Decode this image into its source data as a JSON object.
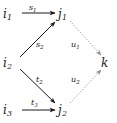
{
  "diagram": {
    "type": "commutative-diagram",
    "background_color": "#ffffff",
    "stroke_color": "#1a1a1a",
    "dotted_stroke_color": "#9a9a9a",
    "nodes": [
      {
        "id": "i1",
        "base": "i",
        "subscript": "1",
        "x": 12,
        "y": 14
      },
      {
        "id": "j1",
        "base": "j",
        "subscript": "1",
        "x": 64,
        "y": 14
      },
      {
        "id": "i2",
        "base": "i",
        "subscript": "2",
        "x": 12,
        "y": 63
      },
      {
        "id": "k",
        "base": "k",
        "subscript": "",
        "x": 105,
        "y": 63
      },
      {
        "id": "i3",
        "base": "i",
        "subscript": "3",
        "x": 12,
        "y": 110
      },
      {
        "id": "j2",
        "base": "j",
        "subscript": "2",
        "x": 64,
        "y": 110
      }
    ],
    "edges": [
      {
        "id": "e-s1",
        "from": "i1",
        "to": "j1",
        "label_base": "s",
        "label_subscript": "1",
        "style": "solid",
        "direction": "right"
      },
      {
        "id": "e-s2",
        "from": "i2",
        "to": "j1",
        "label_base": "s",
        "label_subscript": "2",
        "style": "solid",
        "direction": "up-right"
      },
      {
        "id": "e-t2",
        "from": "i2",
        "to": "j2",
        "label_base": "t",
        "label_subscript": "2",
        "style": "solid",
        "direction": "down-right"
      },
      {
        "id": "e-t3",
        "from": "i3",
        "to": "j2",
        "label_base": "t",
        "label_subscript": "3",
        "style": "solid",
        "direction": "right"
      },
      {
        "id": "e-u1",
        "from": "j1",
        "to": "k",
        "label_base": "u",
        "label_subscript": "1",
        "style": "dotted",
        "direction": "down-right"
      },
      {
        "id": "e-u2",
        "from": "j2",
        "to": "k",
        "label_base": "u",
        "label_subscript": "2",
        "style": "dotted",
        "direction": "up-right"
      }
    ]
  }
}
